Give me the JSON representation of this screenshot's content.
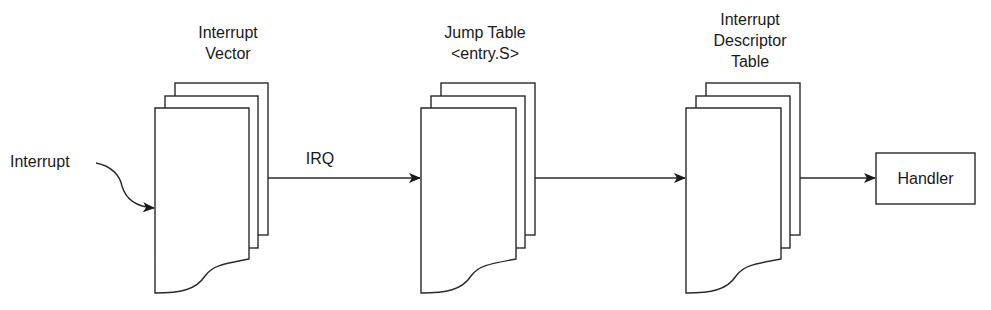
{
  "diagram": {
    "nodes": [
      {
        "id": "interrupt-vector",
        "label_lines": [
          "Interrupt",
          "Vector"
        ],
        "shape": "document-stack"
      },
      {
        "id": "jump-table",
        "label_lines": [
          "Jump Table",
          "<entry.S>"
        ],
        "shape": "document-stack"
      },
      {
        "id": "idt",
        "label_lines": [
          "Interrupt",
          "Descriptor",
          "Table"
        ],
        "shape": "document-stack"
      },
      {
        "id": "handler",
        "label": "Handler",
        "shape": "rectangle"
      }
    ],
    "edges": [
      {
        "from": "Interrupt",
        "to": "interrupt-vector",
        "label": "",
        "style": "curved-arrow"
      },
      {
        "from": "interrupt-vector",
        "to": "jump-table",
        "label": "IRQ"
      },
      {
        "from": "jump-table",
        "to": "idt",
        "label": ""
      },
      {
        "from": "idt",
        "to": "handler",
        "label": ""
      }
    ],
    "source_label": "Interrupt",
    "edge_label_irq": "IRQ",
    "colors": {
      "stroke": "#2a2a2a",
      "text": "#1a1a1a",
      "background": "#ffffff"
    }
  }
}
